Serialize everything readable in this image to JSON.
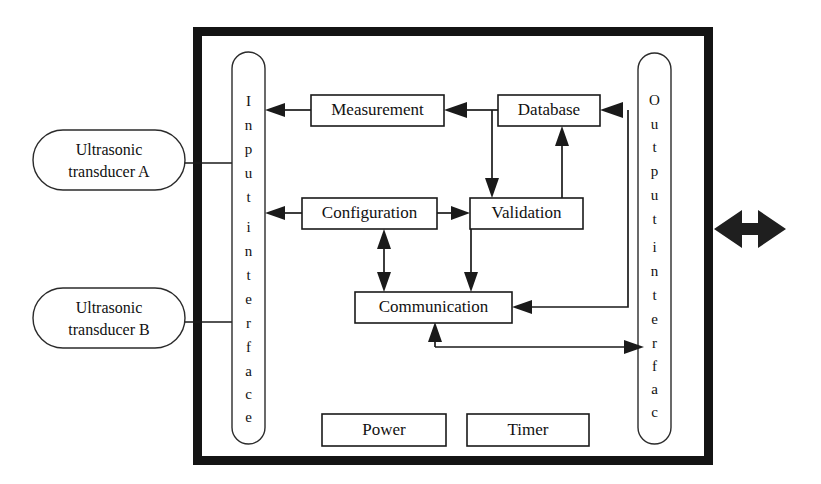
{
  "diagram": {
    "colors": {
      "stroke": "#1a1a1a",
      "frame": "#141414",
      "fill": "#ffffff"
    },
    "external_nodes": [
      {
        "id": "transducer-a",
        "line1": "Ultrasonic",
        "line2": "transducer A"
      },
      {
        "id": "transducer-b",
        "line1": "Ultrasonic",
        "line2": "transducer B"
      }
    ],
    "interfaces": [
      {
        "id": "input-interface",
        "label": "Input interface",
        "chars": [
          "I",
          "n",
          "p",
          "u",
          "t",
          "i",
          "n",
          "t",
          "e",
          "r",
          "f",
          "a",
          "c",
          "e"
        ]
      },
      {
        "id": "output-interface",
        "label": "Output interface",
        "chars": [
          "O",
          "u",
          "t",
          "p",
          "u",
          "t",
          "i",
          "n",
          "t",
          "e",
          "r",
          "f",
          "a",
          "c",
          "e"
        ]
      }
    ],
    "modules": [
      {
        "id": "measurement",
        "label": "Measurement"
      },
      {
        "id": "database",
        "label": "Database"
      },
      {
        "id": "configuration",
        "label": "Configuration"
      },
      {
        "id": "validation",
        "label": "Validation"
      },
      {
        "id": "communication",
        "label": "Communication"
      },
      {
        "id": "power",
        "label": "Power"
      },
      {
        "id": "timer",
        "label": "Timer"
      }
    ],
    "external_link": {
      "id": "bidirectional-link",
      "label": ""
    }
  }
}
